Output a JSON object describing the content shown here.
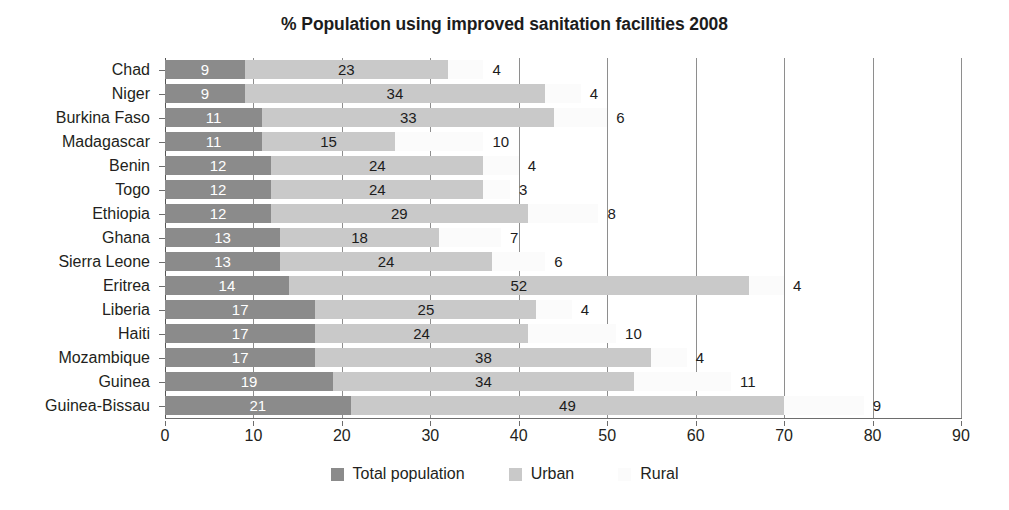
{
  "chart_data": {
    "type": "bar",
    "orientation": "horizontal",
    "title": "% Population using improved sanitation facilities 2008",
    "xlabel": "",
    "ylabel": "",
    "xlim": [
      0,
      90
    ],
    "xticks": [
      0,
      10,
      20,
      30,
      40,
      50,
      60,
      70,
      80,
      90
    ],
    "grid": true,
    "grid_axis": "x",
    "legend_position": "bottom",
    "stacked": true,
    "categories": [
      "Chad",
      "Niger",
      "Burkina Faso",
      "Madagascar",
      "Benin",
      "Togo",
      "Ethiopia",
      "Ghana",
      "Sierra Leone",
      "Eritrea",
      "Liberia",
      "Haiti",
      "Mozambique",
      "Guinea",
      "Guinea-Bissau"
    ],
    "series": [
      {
        "name": "Total population",
        "color": "#8b8b8b",
        "values": [
          9,
          9,
          11,
          11,
          12,
          12,
          12,
          13,
          13,
          14,
          17,
          17,
          17,
          19,
          21
        ]
      },
      {
        "name": "Urban",
        "color": "#c9c9c9",
        "values": [
          23,
          34,
          33,
          15,
          24,
          24,
          29,
          18,
          24,
          52,
          25,
          24,
          38,
          34,
          49
        ]
      },
      {
        "name": "Rural",
        "color": "#fbfbfb",
        "values": [
          4,
          4,
          6,
          10,
          4,
          3,
          8,
          7,
          6,
          4,
          4,
          10,
          4,
          11,
          9
        ]
      }
    ]
  },
  "legend": {
    "items": [
      {
        "label": "Total population",
        "color": "#8b8b8b"
      },
      {
        "label": "Urban",
        "color": "#c9c9c9"
      },
      {
        "label": "Rural",
        "color": "#fbfbfb"
      }
    ]
  }
}
